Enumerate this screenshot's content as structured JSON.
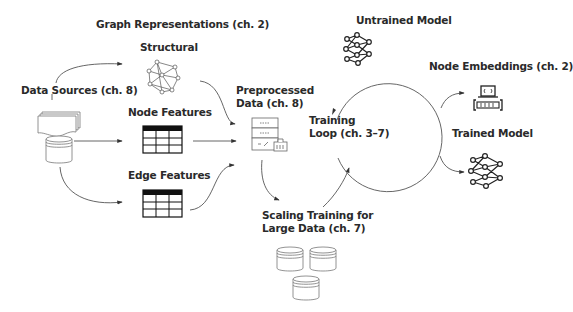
{
  "diagram": {
    "labels": {
      "graph_representations": "Graph Representations (ch. 2)",
      "structural": "Structural",
      "data_sources": "Data Sources (ch. 8)",
      "node_features": "Node Features",
      "edge_features": "Edge Features",
      "preprocessed_line1": "Preprocessed",
      "preprocessed_line2": "Data (ch. 8)",
      "untrained_model": "Untrained Model",
      "training_line1": "Training",
      "training_line2": "Loop (ch. 3–7)",
      "node_embeddings": "Node Embeddings (ch. 2)",
      "trained_model": "Trained Model",
      "scaling_line1": "Scaling Training for",
      "scaling_line2": "Large Data (ch. 7)"
    },
    "icons": {
      "documents": "document-stack-icon",
      "source_db": "database-icon",
      "structural": "graph-network-icon",
      "node_table": "table-icon",
      "edge_table": "table-icon",
      "preprocessed": "server-icon",
      "untrained": "neural-network-icon",
      "embeddings": "laptop-code-icon",
      "trained": "neural-network-icon",
      "scaling": "database-cluster-icon"
    },
    "colors": {
      "text": "#2a2a2a",
      "line": "#555555",
      "icon_stroke": "#222222",
      "light_stroke": "#777777",
      "background": "#ffffff"
    }
  }
}
